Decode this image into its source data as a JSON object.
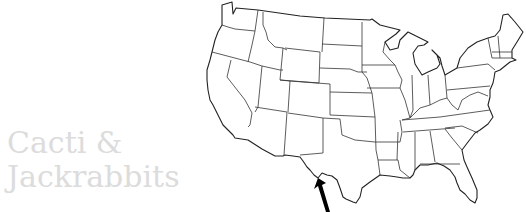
{
  "caption": {
    "line1": "Cacti &",
    "line2": "Jackrabbits"
  },
  "map": {
    "subject": "United States outline map with state borders",
    "arrow": {
      "target": "southwest Texas border (Big Bend)",
      "color": "#000000"
    }
  },
  "colors": {
    "caption_text": "#dcdcdc",
    "map_stroke": "#222222",
    "background": "#ffffff"
  }
}
